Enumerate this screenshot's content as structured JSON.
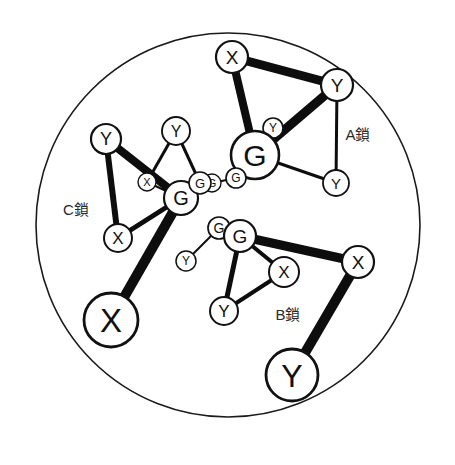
{
  "figure": {
    "title": "",
    "background_color": "#ffffff",
    "ink_color": "#111111",
    "membrane": {
      "cx": 228,
      "cy": 225,
      "r": 192,
      "stroke": "#1a1a1a",
      "stroke_width": 1.6
    }
  },
  "chain_labels": [
    {
      "id": "chain-a",
      "text": "A鎖",
      "x": 358,
      "y": 134
    },
    {
      "id": "chain-b",
      "text": "B鎖",
      "x": 288,
      "y": 314
    },
    {
      "id": "chain-c",
      "text": "C鎖",
      "x": 76,
      "y": 209
    }
  ],
  "nodes": [
    {
      "id": "a-x-top",
      "label": "X",
      "x": 232,
      "y": 57,
      "r": 16,
      "sw": 2.2,
      "fs": 19,
      "chain": "A"
    },
    {
      "id": "a-y-right",
      "label": "Y",
      "x": 337,
      "y": 85,
      "r": 16,
      "sw": 2.2,
      "fs": 19,
      "chain": "A"
    },
    {
      "id": "a-y-small",
      "label": "Y",
      "x": 273,
      "y": 128,
      "r": 10,
      "sw": 1.6,
      "fs": 12,
      "chain": "A"
    },
    {
      "id": "a-g-main",
      "label": "G",
      "x": 255,
      "y": 155,
      "r": 24,
      "sw": 2.6,
      "fs": 30,
      "chain": "A"
    },
    {
      "id": "a-g-mid",
      "label": "G",
      "x": 236,
      "y": 178,
      "r": 10,
      "sw": 1.6,
      "fs": 12,
      "chain": "A"
    },
    {
      "id": "a-g-small",
      "label": "G",
      "x": 212,
      "y": 183,
      "r": 9,
      "sw": 1.4,
      "fs": 11,
      "chain": "A"
    },
    {
      "id": "a-y-lower",
      "label": "Y",
      "x": 336,
      "y": 183,
      "r": 13,
      "sw": 1.8,
      "fs": 15,
      "chain": "A"
    },
    {
      "id": "b-g-small",
      "label": "G",
      "x": 219,
      "y": 228,
      "r": 11,
      "sw": 1.7,
      "fs": 14,
      "chain": "B"
    },
    {
      "id": "b-g-main",
      "label": "G",
      "x": 240,
      "y": 236,
      "r": 16,
      "sw": 2.2,
      "fs": 19,
      "chain": "B"
    },
    {
      "id": "b-y-small",
      "label": "Y",
      "x": 186,
      "y": 261,
      "r": 10,
      "sw": 1.5,
      "fs": 12,
      "chain": "B"
    },
    {
      "id": "b-x-right",
      "label": "X",
      "x": 284,
      "y": 272,
      "r": 15,
      "sw": 2.0,
      "fs": 17,
      "chain": "B"
    },
    {
      "id": "b-y-bottom",
      "label": "Y",
      "x": 224,
      "y": 311,
      "r": 14,
      "sw": 2.0,
      "fs": 17,
      "chain": "B"
    },
    {
      "id": "b-x-outer",
      "label": "X",
      "x": 358,
      "y": 262,
      "r": 16,
      "sw": 2.2,
      "fs": 19,
      "chain": "B"
    },
    {
      "id": "b-y-outer",
      "label": "Y",
      "x": 292,
      "y": 375,
      "r": 26,
      "sw": 2.8,
      "fs": 32,
      "chain": "B"
    },
    {
      "id": "c-y-left",
      "label": "Y",
      "x": 106,
      "y": 139,
      "r": 15,
      "sw": 2.2,
      "fs": 18,
      "chain": "C"
    },
    {
      "id": "c-y-top",
      "label": "Y",
      "x": 176,
      "y": 131,
      "r": 14,
      "sw": 1.9,
      "fs": 16,
      "chain": "C"
    },
    {
      "id": "c-x-small",
      "label": "X",
      "x": 147,
      "y": 182,
      "r": 9,
      "sw": 1.4,
      "fs": 11,
      "chain": "C"
    },
    {
      "id": "c-g-main",
      "label": "G",
      "x": 181,
      "y": 198,
      "r": 17,
      "sw": 2.2,
      "fs": 20,
      "chain": "C"
    },
    {
      "id": "c-g-small",
      "label": "G",
      "x": 200,
      "y": 183,
      "r": 11,
      "sw": 1.6,
      "fs": 13,
      "chain": "C"
    },
    {
      "id": "c-x-lower",
      "label": "X",
      "x": 118,
      "y": 238,
      "r": 14,
      "sw": 2.0,
      "fs": 17,
      "chain": "C"
    },
    {
      "id": "c-x-outer",
      "label": "X",
      "x": 111,
      "y": 320,
      "r": 27,
      "sw": 2.8,
      "fs": 33,
      "chain": "C"
    }
  ],
  "edges": [
    {
      "id": "e-a1",
      "from": "a-x-top",
      "to": "a-y-right",
      "width": 9,
      "kind": "thick"
    },
    {
      "id": "e-a2",
      "from": "a-x-top",
      "to": "a-g-main",
      "width": 8,
      "kind": "thick"
    },
    {
      "id": "e-a3",
      "from": "a-y-right",
      "to": "a-g-main",
      "width": 9,
      "kind": "thick"
    },
    {
      "id": "e-a4",
      "from": "a-y-right",
      "to": "a-y-lower",
      "width": 3,
      "kind": "thin"
    },
    {
      "id": "e-a5",
      "from": "a-g-main",
      "to": "a-y-lower",
      "width": 3,
      "kind": "thin"
    },
    {
      "id": "e-a6",
      "from": "a-g-main",
      "to": "a-y-small",
      "width": 2,
      "kind": "thin"
    },
    {
      "id": "e-a7",
      "from": "a-g-main",
      "to": "a-g-mid",
      "width": 2,
      "kind": "thin"
    },
    {
      "id": "e-a8",
      "from": "a-g-mid",
      "to": "a-g-small",
      "width": 2,
      "kind": "thin"
    },
    {
      "id": "e-b1",
      "from": "b-g-main",
      "to": "b-x-outer",
      "width": 9,
      "kind": "thick"
    },
    {
      "id": "e-b2",
      "from": "b-x-outer",
      "to": "b-y-outer",
      "width": 10,
      "kind": "thick"
    },
    {
      "id": "e-b3",
      "from": "b-g-main",
      "to": "b-x-right",
      "width": 4,
      "kind": "thin"
    },
    {
      "id": "e-b4",
      "from": "b-g-main",
      "to": "b-y-bottom",
      "width": 5,
      "kind": "thin"
    },
    {
      "id": "e-b5",
      "from": "b-x-right",
      "to": "b-y-bottom",
      "width": 4,
      "kind": "thin"
    },
    {
      "id": "e-b6",
      "from": "b-g-main",
      "to": "b-g-small",
      "width": 2,
      "kind": "thin"
    },
    {
      "id": "e-b7",
      "from": "b-g-small",
      "to": "b-y-small",
      "width": 2,
      "kind": "thin"
    },
    {
      "id": "e-c1",
      "from": "c-y-left",
      "to": "c-g-main",
      "width": 8,
      "kind": "thick"
    },
    {
      "id": "e-c2",
      "from": "c-y-left",
      "to": "c-x-lower",
      "width": 6,
      "kind": "thick"
    },
    {
      "id": "e-c3",
      "from": "c-x-lower",
      "to": "c-g-main",
      "width": 5,
      "kind": "thin"
    },
    {
      "id": "e-c4",
      "from": "c-g-main",
      "to": "c-x-outer",
      "width": 10,
      "kind": "thick"
    },
    {
      "id": "e-c5",
      "from": "c-y-top",
      "to": "c-g-small",
      "width": 3,
      "kind": "thin"
    },
    {
      "id": "e-c6",
      "from": "c-y-top",
      "to": "c-x-small",
      "width": 3,
      "kind": "thin"
    },
    {
      "id": "e-c7",
      "from": "c-g-main",
      "to": "c-g-small",
      "width": 2,
      "kind": "thin"
    },
    {
      "id": "e-c8",
      "from": "c-x-small",
      "to": "c-g-main",
      "width": 2,
      "kind": "thin"
    }
  ],
  "legend": {
    "node_kinds": [
      "X",
      "Y",
      "G"
    ]
  }
}
